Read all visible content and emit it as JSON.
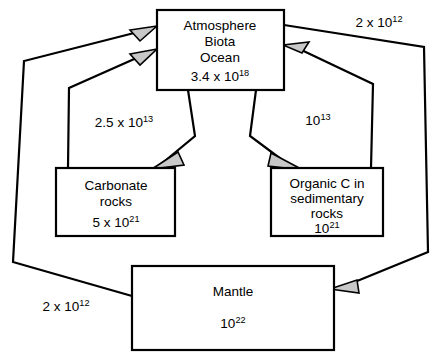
{
  "diagram": {
    "colors": {
      "stroke": "#000000",
      "background": "#ffffff",
      "arrow_fill": "#c8c8c8"
    },
    "boxes": {
      "atmosphere": {
        "name": "atmosphere-biota-ocean-box",
        "line1": "Atmosphere",
        "line2": "Biota",
        "line3": "Ocean",
        "value_mantissa": "3.4 x 10",
        "value_exponent": "18"
      },
      "carbonate": {
        "name": "carbonate-rocks-box",
        "line1": "Carbonate",
        "line2": "rocks",
        "value_mantissa": "5 x 10",
        "value_exponent": "21"
      },
      "organic": {
        "name": "organic-carbon-box",
        "line1": "Organic C in",
        "line2": "sedimentary",
        "line3": "rocks",
        "value_mantissa": "10",
        "value_exponent": "21"
      },
      "mantle": {
        "name": "mantle-box",
        "line1": "Mantle",
        "value_mantissa": "10",
        "value_exponent": "22"
      }
    },
    "fluxes": {
      "atmosphere_to_carbonate": {
        "mantissa": "2.5 x 10",
        "exponent": "13"
      },
      "atmosphere_to_organic": {
        "mantissa": "10",
        "exponent": "13"
      },
      "atmosphere_to_mantle_right": {
        "mantissa": "2 x 10",
        "exponent": "12"
      },
      "mantle_to_atmosphere_left": {
        "mantissa": "2 x 10",
        "exponent": "12"
      }
    }
  }
}
